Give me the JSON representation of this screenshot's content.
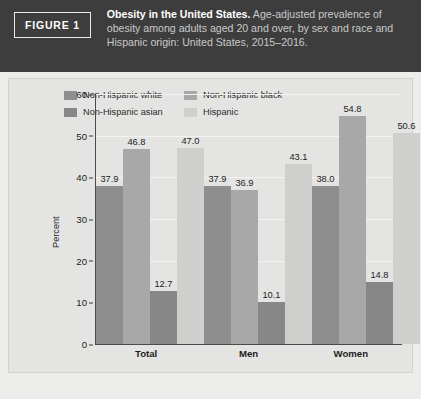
{
  "header": {
    "badge": "FIGURE 1",
    "title": "Obesity in the United States.",
    "subtitle": " Age-adjusted prevalence of obesity among adults aged 20 and over, by sex and race and Hispanic origin: United States, 2015–2016."
  },
  "chart_data": {
    "type": "bar",
    "title": "Obesity in the United States.",
    "xlabel": "",
    "ylabel": "Percent",
    "ylim": [
      0,
      60
    ],
    "yticks": [
      0,
      10,
      20,
      30,
      40,
      50,
      60
    ],
    "grid": true,
    "legend_position": "top",
    "categories": [
      "Total",
      "Men",
      "Women"
    ],
    "series": [
      {
        "name": "Non-Hispanic white",
        "color": "#8e8e8e",
        "values": [
          37.9,
          37.9,
          38.0
        ],
        "labels": [
          "37.9",
          "37.9",
          "38.0"
        ]
      },
      {
        "name": "Non-Hispanic black",
        "color": "#a8a8a8",
        "values": [
          46.8,
          36.9,
          54.8
        ],
        "labels": [
          "46.8",
          "36.9",
          "54.8"
        ]
      },
      {
        "name": "Non-Hispanic asian",
        "color": "#878787",
        "values": [
          12.7,
          10.1,
          14.8
        ],
        "labels": [
          "12.7",
          "10.1",
          "14.8"
        ]
      },
      {
        "name": "Hispanic",
        "color": "#cfcfcd",
        "values": [
          47.0,
          43.1,
          50.6
        ],
        "labels": [
          "47.0",
          "43.1",
          "50.6"
        ]
      }
    ]
  },
  "colors": {
    "header_bg": "#3d3d3d",
    "panel_bg": "#e4e4e2",
    "page_bg": "#ececea",
    "axis": "#4a4a4a",
    "gridline": "#f2f2f0"
  }
}
